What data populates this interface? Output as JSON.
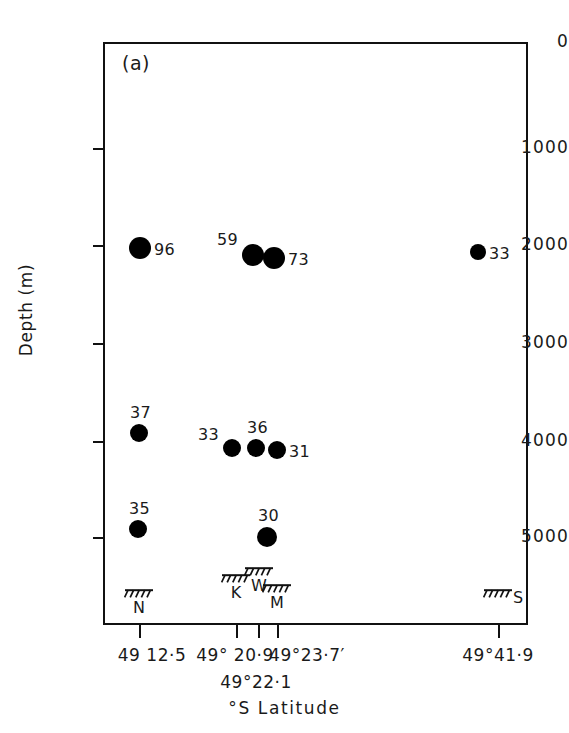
{
  "figure": {
    "panel_label": "(a)"
  },
  "chart_data": {
    "type": "scatter",
    "title": "(a)",
    "xlabel": "°S Latitude",
    "ylabel": "Depth (m)",
    "y_ticks": [
      0,
      1000,
      2000,
      3000,
      4000,
      5000
    ],
    "y_tick_labels": [
      "0",
      "1000",
      "2000",
      "3000",
      "4000",
      "5000"
    ],
    "ylim": [
      0,
      5600
    ],
    "y_axis_inverted": true,
    "grid": false,
    "legend": null,
    "x_tick_labels": [
      "49 12·5",
      "49° 20·9",
      "49°22·1",
      "49°23·7′",
      "49°41·9"
    ],
    "stations": [
      "N",
      "K",
      "W",
      "M",
      "S"
    ],
    "points": [
      {
        "label": "96",
        "station": "N",
        "depth": 2000,
        "x_px": 140,
        "y_px": 248,
        "r": 11,
        "label_side": "right"
      },
      {
        "label": "59",
        "station": "K",
        "depth": 2060,
        "x_px": 253,
        "y_px": 255,
        "r": 11,
        "label_side": "above-left"
      },
      {
        "label": "73",
        "station": "W",
        "depth": 2070,
        "x_px": 274,
        "y_px": 258,
        "r": 11,
        "label_side": "right"
      },
      {
        "label": "33",
        "station": "S",
        "depth": 2060,
        "x_px": 478,
        "y_px": 252,
        "r": 8,
        "label_side": "right"
      },
      {
        "label": "37",
        "station": "N",
        "depth": 3950,
        "x_px": 139,
        "y_px": 433,
        "r": 9,
        "label_side": "above"
      },
      {
        "label": "33",
        "station": "K",
        "depth": 4000,
        "x_px": 232,
        "y_px": 448,
        "r": 9,
        "label_side": "above-left"
      },
      {
        "label": "36",
        "station": "W",
        "depth": 4000,
        "x_px": 256,
        "y_px": 448,
        "r": 9,
        "label_side": "above"
      },
      {
        "label": "31",
        "station": "M",
        "depth": 4000,
        "x_px": 277,
        "y_px": 450,
        "r": 9,
        "label_side": "right"
      },
      {
        "label": "35",
        "station": "N",
        "depth": 4920,
        "x_px": 138,
        "y_px": 529,
        "r": 9,
        "label_side": "above"
      },
      {
        "label": "30",
        "station": "M",
        "depth": 4960,
        "x_px": 267,
        "y_px": 537,
        "r": 10,
        "label_side": "above"
      }
    ]
  },
  "y_axis": {
    "title": "Depth (m)",
    "ticks": [
      {
        "label": "0",
        "y": 42
      },
      {
        "label": "1000",
        "y": 148
      },
      {
        "label": "2000",
        "y": 245
      },
      {
        "label": "3000",
        "y": 343
      },
      {
        "label": "4000",
        "y": 441
      },
      {
        "label": "5000",
        "y": 537
      }
    ]
  },
  "x_axis": {
    "title": "°S Latitude",
    "ticks": [
      {
        "label": "49 12·5",
        "x": 139,
        "label_x": 152,
        "row": 1
      },
      {
        "label": "49° 20·9",
        "x": 236,
        "label_x": 235,
        "row": 1
      },
      {
        "label": "49°22·1",
        "x": 258,
        "label_x": 256,
        "row": 2
      },
      {
        "label": "49°23·7′",
        "x": 277,
        "label_x": 307,
        "row": 1
      },
      {
        "label": "49°41·9",
        "x": 498,
        "label_x": 498,
        "row": 1
      }
    ],
    "stations": [
      {
        "letter": "N",
        "x": 139,
        "hatch_y": 588,
        "letter_pos": "below"
      },
      {
        "letter": "K",
        "x": 236,
        "hatch_y": 573,
        "letter_pos": "below"
      },
      {
        "letter": "W",
        "x": 259,
        "hatch_y": 566,
        "letter_pos": "below"
      },
      {
        "letter": "M",
        "x": 277,
        "hatch_y": 583,
        "letter_pos": "below"
      },
      {
        "letter": "S",
        "x": 498,
        "hatch_y": 588,
        "letter_pos": "right"
      }
    ]
  }
}
